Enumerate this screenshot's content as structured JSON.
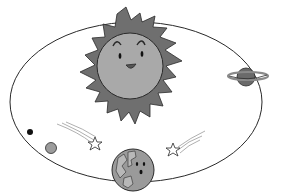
{
  "illustration": {
    "subject": "Solar system cartoon",
    "colors": {
      "background": "#ffffff",
      "outline": "#2a2a2a",
      "sun_rays": "#6f6f6f",
      "sun_face": "#a9a9a9",
      "saturn_body": "#6a6a6a",
      "saturn_ring": "#8a8a8a",
      "earth_fill": "#9a9a9a",
      "small_planet": "#9c9c9c",
      "tiny_planet": "#111111",
      "star_fill": "#ffffff",
      "trail": "#9a9a9a"
    },
    "elements": [
      {
        "name": "sun",
        "label": "Smiling sun"
      },
      {
        "name": "orbit",
        "label": "Elliptical orbit"
      },
      {
        "name": "saturn",
        "label": "Ringed planet"
      },
      {
        "name": "earth",
        "label": "Earth with face"
      },
      {
        "name": "shooting-star-left",
        "label": "Shooting star"
      },
      {
        "name": "shooting-star-right",
        "label": "Shooting star"
      },
      {
        "name": "small-planet",
        "label": "Small planet"
      },
      {
        "name": "tiny-planet",
        "label": "Tiny planet"
      }
    ]
  }
}
